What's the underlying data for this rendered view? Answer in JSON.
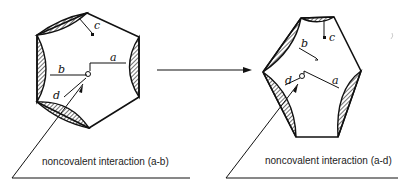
{
  "diagram": {
    "left_state": {
      "labels": {
        "a": "a",
        "b": "b",
        "c": "c",
        "d": "d"
      },
      "caption": "noncovalent interaction (a-b)"
    },
    "right_state": {
      "labels": {
        "a": "a",
        "b": "b",
        "c": "c",
        "d": "d"
      },
      "caption": "noncovalent interaction (a-d)"
    },
    "transition_arrow": "→",
    "colors": {
      "stroke": "#111111",
      "background": "#ffffff"
    }
  }
}
